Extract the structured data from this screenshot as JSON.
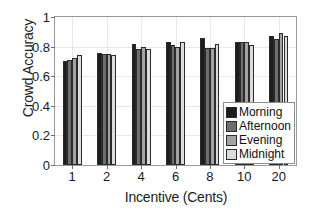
{
  "chart_data": {
    "type": "bar",
    "title": "",
    "xlabel": "Incentive (Cents)",
    "ylabel": "Crowd Accuracy",
    "categories": [
      "1",
      "2",
      "4",
      "6",
      "8",
      "10",
      "20"
    ],
    "ylim": [
      0,
      1
    ],
    "yticks": [
      0,
      0.2,
      0.4,
      0.6,
      0.8,
      1
    ],
    "ytick_labels": [
      "0",
      "0.2",
      "0.4",
      "0.6",
      "0.8",
      "1"
    ],
    "xtick_labels": [
      "1",
      "2",
      "4",
      "6",
      "8",
      "10",
      "20"
    ],
    "grid": true,
    "legend_position": "lower-right",
    "series": [
      {
        "name": "Morning",
        "color": "#1d1d1d",
        "values": [
          0.7,
          0.757,
          0.815,
          0.833,
          0.855,
          0.833,
          0.873
        ]
      },
      {
        "name": "Afternoon",
        "color": "#6e6e6e",
        "values": [
          0.707,
          0.752,
          0.782,
          0.808,
          0.793,
          0.828,
          0.852
        ]
      },
      {
        "name": "Evening",
        "color": "#a3a3a3",
        "values": [
          0.722,
          0.752,
          0.795,
          0.797,
          0.79,
          0.833,
          0.89
        ]
      },
      {
        "name": "Midnight",
        "color": "#dcdcdc",
        "values": [
          0.74,
          0.742,
          0.783,
          0.833,
          0.817,
          0.81,
          0.87
        ]
      }
    ]
  },
  "legend": {
    "items": [
      {
        "label": "Morning",
        "color": "#1d1d1d"
      },
      {
        "label": "Afternoon",
        "color": "#6e6e6e"
      },
      {
        "label": "Evening",
        "color": "#a3a3a3"
      },
      {
        "label": "Midnight",
        "color": "#dcdcdc"
      }
    ]
  }
}
